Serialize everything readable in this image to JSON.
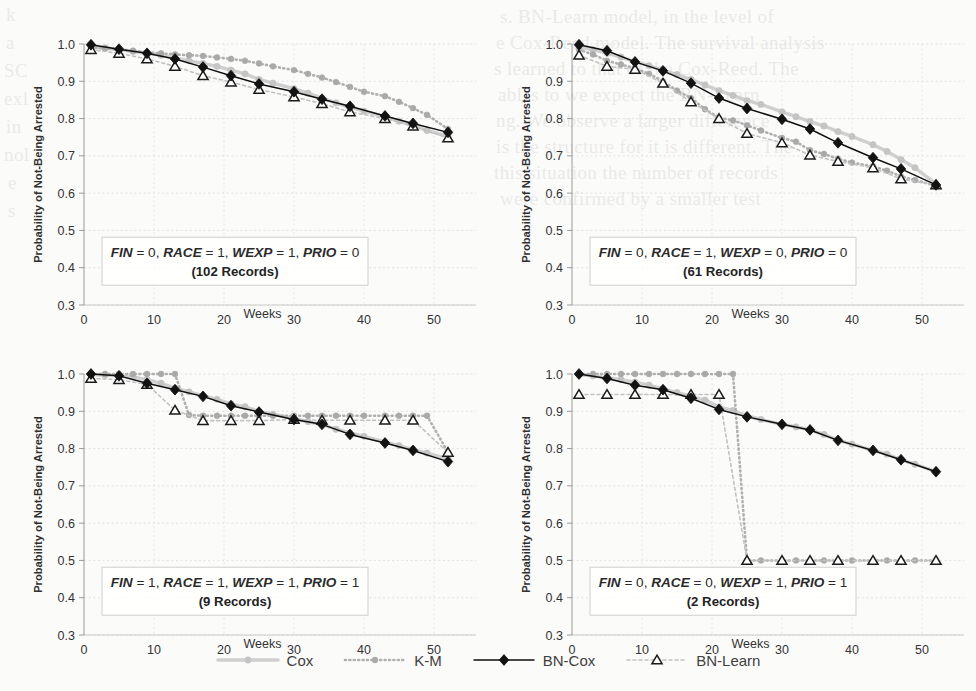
{
  "figure": {
    "axis": {
      "ylabel": "Probability of Not-Being Arrested",
      "xlabel": "Weeks",
      "yticks": [
        "1.0",
        "0.9",
        "0.8",
        "0.7",
        "0.6",
        "0.5",
        "0.4",
        "0.3"
      ],
      "xticks": [
        "0",
        "10",
        "20",
        "30",
        "40",
        "50"
      ],
      "ylim": [
        0.3,
        1.0
      ],
      "xlim": [
        0,
        56
      ]
    },
    "legend": [
      {
        "name": "Cox",
        "style": "solid-light",
        "marker": "circle",
        "color": "#c9c9c9"
      },
      {
        "name": "K-M",
        "style": "dotted",
        "marker": "circle",
        "color": "#a8a8a8"
      },
      {
        "name": "BN-Cox",
        "style": "solid-dark",
        "marker": "diamond",
        "color": "#141414"
      },
      {
        "name": "BN-Learn",
        "style": "dashed-light",
        "marker": "triangle",
        "color": "#bdbdbd"
      }
    ]
  },
  "chart_data": [
    {
      "type": "line",
      "panel": "top-left",
      "title": "",
      "annotation_line1": "FIN = 0, RACE = 1, WEXP = 1, PRIO = 0",
      "annotation_line2": "(102 Records)",
      "annotation_vars": [
        "FIN",
        "0",
        "RACE",
        "1",
        "WEXP",
        "1",
        "PRIO",
        "0"
      ],
      "records": 102,
      "xlabel": "Weeks",
      "ylabel": "Probability of Not-Being Arrested",
      "ylim": [
        0.3,
        1.0
      ],
      "xlim": [
        0,
        56
      ],
      "grid": true,
      "x_marker": [
        1,
        5,
        9,
        13,
        17,
        21,
        25,
        30,
        34,
        38,
        43,
        47,
        52
      ],
      "series": [
        {
          "name": "Cox",
          "x": [
            1,
            3,
            5,
            7,
            9,
            11,
            13,
            15,
            17,
            19,
            21,
            23,
            25,
            27,
            30,
            32,
            34,
            36,
            38,
            40,
            43,
            45,
            47,
            49,
            52
          ],
          "values": [
            0.993,
            0.99,
            0.985,
            0.98,
            0.975,
            0.97,
            0.962,
            0.955,
            0.948,
            0.94,
            0.93,
            0.92,
            0.905,
            0.895,
            0.88,
            0.868,
            0.855,
            0.842,
            0.83,
            0.82,
            0.805,
            0.793,
            0.782,
            0.768,
            0.752
          ]
        },
        {
          "name": "K-M",
          "x": [
            1,
            3,
            5,
            7,
            9,
            11,
            13,
            15,
            17,
            19,
            21,
            23,
            25,
            27,
            30,
            32,
            34,
            36,
            38,
            40,
            43,
            45,
            47,
            49,
            52
          ],
          "values": [
            0.99,
            0.988,
            0.985,
            0.982,
            0.978,
            0.975,
            0.972,
            0.97,
            0.968,
            0.964,
            0.96,
            0.955,
            0.948,
            0.94,
            0.93,
            0.92,
            0.91,
            0.898,
            0.885,
            0.872,
            0.86,
            0.845,
            0.828,
            0.81,
            0.772
          ]
        },
        {
          "name": "BN-Cox",
          "x": [
            1,
            5,
            9,
            13,
            17,
            21,
            25,
            30,
            34,
            38,
            43,
            47,
            52
          ],
          "values": [
            0.998,
            0.986,
            0.975,
            0.96,
            0.938,
            0.915,
            0.893,
            0.872,
            0.852,
            0.833,
            0.807,
            0.787,
            0.763
          ]
        },
        {
          "name": "BN-Learn",
          "x": [
            1,
            5,
            9,
            13,
            17,
            21,
            25,
            30,
            34,
            38,
            43,
            47,
            52
          ],
          "values": [
            0.985,
            0.975,
            0.96,
            0.94,
            0.915,
            0.898,
            0.878,
            0.858,
            0.84,
            0.818,
            0.8,
            0.78,
            0.748
          ]
        }
      ]
    },
    {
      "type": "line",
      "panel": "top-right",
      "title": "",
      "annotation_line1": "FIN = 0, RACE = 1, WEXP = 0, PRIO = 0",
      "annotation_line2": "(61 Records)",
      "annotation_vars": [
        "FIN",
        "0",
        "RACE",
        "1",
        "WEXP",
        "0",
        "PRIO",
        "0"
      ],
      "records": 61,
      "xlabel": "Weeks",
      "ylabel": "Probability of Not-Being Arrested",
      "ylim": [
        0.3,
        1.0
      ],
      "xlim": [
        0,
        56
      ],
      "grid": true,
      "x_marker": [
        1,
        5,
        9,
        13,
        17,
        21,
        25,
        30,
        34,
        38,
        43,
        47,
        52
      ],
      "series": [
        {
          "name": "Cox",
          "x": [
            1,
            3,
            5,
            7,
            9,
            11,
            13,
            15,
            17,
            19,
            21,
            23,
            25,
            27,
            30,
            32,
            34,
            36,
            38,
            40,
            43,
            45,
            47,
            49,
            52
          ],
          "values": [
            0.992,
            0.985,
            0.975,
            0.965,
            0.952,
            0.942,
            0.93,
            0.918,
            0.905,
            0.89,
            0.875,
            0.862,
            0.848,
            0.838,
            0.818,
            0.805,
            0.792,
            0.78,
            0.765,
            0.752,
            0.73,
            0.712,
            0.69,
            0.668,
            0.625
          ]
        },
        {
          "name": "K-M",
          "x": [
            1,
            3,
            5,
            7,
            9,
            11,
            13,
            15,
            17,
            19,
            21,
            23,
            25,
            27,
            30,
            32,
            34,
            36,
            38,
            40,
            43,
            45,
            47,
            49,
            52
          ],
          "values": [
            0.985,
            0.972,
            0.955,
            0.945,
            0.935,
            0.92,
            0.9,
            0.875,
            0.855,
            0.825,
            0.802,
            0.795,
            0.782,
            0.768,
            0.748,
            0.738,
            0.715,
            0.705,
            0.692,
            0.682,
            0.672,
            0.66,
            0.645,
            0.635,
            0.62
          ]
        },
        {
          "name": "BN-Cox",
          "x": [
            1,
            5,
            9,
            13,
            17,
            21,
            25,
            30,
            34,
            38,
            43,
            47,
            52
          ],
          "values": [
            0.998,
            0.982,
            0.952,
            0.928,
            0.895,
            0.855,
            0.827,
            0.798,
            0.772,
            0.735,
            0.695,
            0.665,
            0.622
          ]
        },
        {
          "name": "BN-Learn",
          "x": [
            1,
            5,
            9,
            13,
            17,
            21,
            25,
            30,
            34,
            38,
            43,
            47,
            52
          ],
          "values": [
            0.97,
            0.94,
            0.932,
            0.895,
            0.845,
            0.8,
            0.76,
            0.735,
            0.702,
            0.685,
            0.668,
            0.638,
            0.622
          ]
        }
      ]
    },
    {
      "type": "line",
      "panel": "bottom-left",
      "title": "",
      "annotation_line1": "FIN = 1, RACE = 1, WEXP = 1, PRIO = 1",
      "annotation_line2": "(9 Records)",
      "annotation_vars": [
        "FIN",
        "1",
        "RACE",
        "1",
        "WEXP",
        "1",
        "PRIO",
        "1"
      ],
      "records": 9,
      "xlabel": "Weeks",
      "ylabel": "Probability of Not-Being Arrested",
      "ylim": [
        0.3,
        1.0
      ],
      "xlim": [
        0,
        56
      ],
      "grid": true,
      "x_marker": [
        1,
        5,
        9,
        13,
        17,
        21,
        25,
        30,
        34,
        38,
        43,
        47,
        52
      ],
      "series": [
        {
          "name": "Cox",
          "x": [
            1,
            3,
            5,
            7,
            9,
            11,
            13,
            15,
            17,
            19,
            21,
            23,
            25,
            27,
            30,
            32,
            34,
            36,
            38,
            40,
            43,
            45,
            47,
            49,
            52
          ],
          "values": [
            0.998,
            0.997,
            0.995,
            0.992,
            0.985,
            0.975,
            0.962,
            0.952,
            0.942,
            0.932,
            0.92,
            0.912,
            0.9,
            0.892,
            0.88,
            0.872,
            0.864,
            0.852,
            0.842,
            0.833,
            0.818,
            0.808,
            0.798,
            0.788,
            0.772
          ]
        },
        {
          "name": "K-M",
          "x": [
            1,
            3,
            5,
            7,
            9,
            11,
            13,
            15,
            17,
            19,
            21,
            23,
            25,
            27,
            30,
            32,
            34,
            36,
            38,
            40,
            43,
            45,
            47,
            49,
            52
          ],
          "values": [
            1.0,
            1.0,
            1.0,
            1.0,
            1.0,
            1.0,
            1.0,
            0.89,
            0.888,
            0.888,
            0.888,
            0.888,
            0.888,
            0.888,
            0.888,
            0.888,
            0.888,
            0.888,
            0.888,
            0.888,
            0.888,
            0.888,
            0.888,
            0.888,
            0.79
          ]
        },
        {
          "name": "BN-Cox",
          "x": [
            1,
            5,
            9,
            13,
            17,
            21,
            25,
            30,
            34,
            38,
            43,
            47,
            52
          ],
          "values": [
            1.0,
            0.995,
            0.975,
            0.958,
            0.94,
            0.915,
            0.898,
            0.878,
            0.865,
            0.838,
            0.815,
            0.795,
            0.765
          ]
        },
        {
          "name": "BN-Learn",
          "x": [
            1,
            5,
            9,
            13,
            17,
            21,
            25,
            30,
            34,
            38,
            43,
            47,
            52
          ],
          "values": [
            0.988,
            0.985,
            0.972,
            0.903,
            0.875,
            0.875,
            0.875,
            0.878,
            0.876,
            0.876,
            0.876,
            0.876,
            0.79
          ]
        }
      ]
    },
    {
      "type": "line",
      "panel": "bottom-right",
      "title": "",
      "annotation_line1": "FIN = 0, RACE = 0, WEXP = 1, PRIO = 1",
      "annotation_line2": "(2 Records)",
      "annotation_vars": [
        "FIN",
        "0",
        "RACE",
        "0",
        "WEXP",
        "1",
        "PRIO",
        "1"
      ],
      "records": 2,
      "xlabel": "Weeks",
      "ylabel": "Probability of Not-Being Arrested",
      "ylim": [
        0.3,
        1.0
      ],
      "xlim": [
        0,
        56
      ],
      "grid": true,
      "x_marker": [
        1,
        5,
        9,
        13,
        17,
        21,
        25,
        30,
        34,
        38,
        43,
        47,
        52
      ],
      "series": [
        {
          "name": "Cox",
          "x": [
            1,
            3,
            5,
            7,
            9,
            11,
            13,
            15,
            17,
            19,
            21,
            23,
            25,
            27,
            30,
            32,
            34,
            36,
            38,
            40,
            43,
            45,
            47,
            49,
            52
          ],
          "values": [
            0.998,
            0.995,
            0.99,
            0.985,
            0.978,
            0.97,
            0.96,
            0.95,
            0.94,
            0.93,
            0.912,
            0.902,
            0.888,
            0.878,
            0.865,
            0.858,
            0.85,
            0.838,
            0.822,
            0.812,
            0.795,
            0.785,
            0.77,
            0.758,
            0.738
          ]
        },
        {
          "name": "K-M",
          "x": [
            1,
            3,
            5,
            7,
            9,
            11,
            13,
            15,
            17,
            19,
            21,
            23,
            25,
            27,
            30,
            32,
            34,
            36,
            38,
            40,
            43,
            45,
            47,
            49,
            52
          ],
          "values": [
            1.0,
            1.0,
            1.0,
            1.0,
            1.0,
            1.0,
            1.0,
            1.0,
            1.0,
            1.0,
            1.0,
            1.0,
            0.5,
            0.5,
            0.5,
            0.5,
            0.5,
            0.5,
            0.5,
            0.5,
            0.5,
            0.5,
            0.5,
            0.5,
            0.5
          ]
        },
        {
          "name": "BN-Cox",
          "x": [
            1,
            5,
            9,
            13,
            17,
            21,
            25,
            30,
            34,
            38,
            43,
            47,
            52
          ],
          "values": [
            1.0,
            0.988,
            0.97,
            0.958,
            0.935,
            0.905,
            0.885,
            0.865,
            0.85,
            0.822,
            0.795,
            0.77,
            0.738
          ]
        },
        {
          "name": "BN-Learn",
          "x": [
            1,
            5,
            9,
            13,
            17,
            21,
            25,
            30,
            34,
            38,
            43,
            47,
            52
          ],
          "values": [
            0.945,
            0.945,
            0.945,
            0.945,
            0.945,
            0.945,
            0.5,
            0.5,
            0.5,
            0.5,
            0.5,
            0.5,
            0.5
          ]
        }
      ]
    }
  ],
  "bleed_text": [
    {
      "t": "s. BN-Learn model, in the level of",
      "x": 500,
      "y": 4
    },
    {
      "t": "e  Cox-Reed model. The survival  analysis",
      "x": 496,
      "y": 30
    },
    {
      "t": "s learned to that of the Cox-Reed. The",
      "x": 494,
      "y": 56
    },
    {
      "t": "ables to we expect the BN-Learn",
      "x": 498,
      "y": 82
    },
    {
      "t": "ng. We observe a larger difference",
      "x": 496,
      "y": 108
    },
    {
      "t": "is the structure for it is different. The",
      "x": 496,
      "y": 134
    },
    {
      "t": "this situation the number of records",
      "x": 494,
      "y": 160
    },
    {
      "t": "were confirmed by a smaller test",
      "x": 500,
      "y": 186
    },
    {
      "t": "k",
      "x": 6,
      "y": 2
    },
    {
      "t": "a",
      "x": 6,
      "y": 30
    },
    {
      "t": "SC",
      "x": 4,
      "y": 58
    },
    {
      "t": "exl",
      "x": 4,
      "y": 86
    },
    {
      "t": "in",
      "x": 6,
      "y": 114
    },
    {
      "t": "nol",
      "x": 4,
      "y": 142
    },
    {
      "t": "e",
      "x": 8,
      "y": 170
    },
    {
      "t": "s",
      "x": 8,
      "y": 198
    }
  ]
}
